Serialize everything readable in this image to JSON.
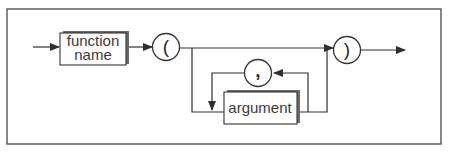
{
  "diagram": {
    "type": "syntax-diagram",
    "nodes": [
      {
        "id": "function_name",
        "kind": "nonterminal",
        "label_line1": "function",
        "label_line2": "name"
      },
      {
        "id": "lparen",
        "kind": "terminal",
        "label": "("
      },
      {
        "id": "argument",
        "kind": "nonterminal",
        "label": "argument"
      },
      {
        "id": "comma",
        "kind": "terminal",
        "label": ","
      },
      {
        "id": "rparen",
        "kind": "terminal",
        "label": ")"
      }
    ],
    "edges": [
      {
        "from": "start",
        "to": "function_name"
      },
      {
        "from": "function_name",
        "to": "lparen"
      },
      {
        "from": "lparen",
        "to": "rparen",
        "note": "bypass (no arguments)"
      },
      {
        "from": "lparen",
        "to": "argument"
      },
      {
        "from": "argument",
        "to": "comma",
        "note": "loop back"
      },
      {
        "from": "comma",
        "to": "argument"
      },
      {
        "from": "argument",
        "to": "rparen"
      },
      {
        "from": "rparen",
        "to": "end"
      }
    ],
    "colors": {
      "line": "#2e2e2e",
      "frame": "#555555",
      "shadow": "#6a6a6a",
      "background": "#ffffff"
    }
  }
}
